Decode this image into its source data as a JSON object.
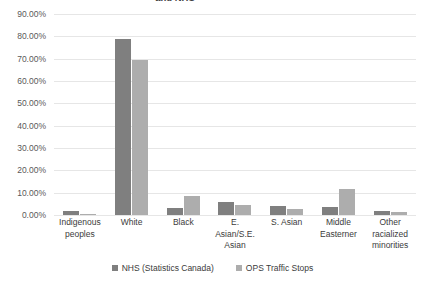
{
  "chart_data": {
    "type": "bar",
    "title": "and NHS",
    "title_note": "Title clipped at top edge of screenshot; only \"and NHS\" visible",
    "xlabel": "",
    "ylabel": "",
    "ylim": [
      0,
      90
    ],
    "ytick_labels": [
      "90.00%",
      "80.00%",
      "70.00%",
      "60.00%",
      "50.00%",
      "40.00%",
      "30.00%",
      "20.00%",
      "10.00%",
      "0.00%"
    ],
    "ytick_values": [
      90,
      80,
      70,
      60,
      50,
      40,
      30,
      20,
      10,
      0
    ],
    "grid": true,
    "legend_position": "bottom",
    "categories": [
      "Indigenous\npeoples",
      "White",
      "Black",
      "E.\nAsian/S.E.\nAsian",
      "S. Asian",
      "Middle\nEasterner",
      "Other\nracialized\nminorities"
    ],
    "series": [
      {
        "name": "NHS (Statistics Canada)",
        "color": "#7f7f7f",
        "values": [
          2.0,
          79.0,
          3.3,
          6.0,
          4.0,
          3.5,
          1.6
        ]
      },
      {
        "name": "OPS Traffic Stops",
        "color": "#adadad",
        "values": [
          0.3,
          69.5,
          8.5,
          4.6,
          2.7,
          11.5,
          1.3
        ]
      }
    ]
  },
  "legend": {
    "items": [
      {
        "label": "NHS (Statistics Canada)",
        "color": "#7f7f7f"
      },
      {
        "label": "OPS Traffic Stops",
        "color": "#adadad"
      }
    ]
  }
}
